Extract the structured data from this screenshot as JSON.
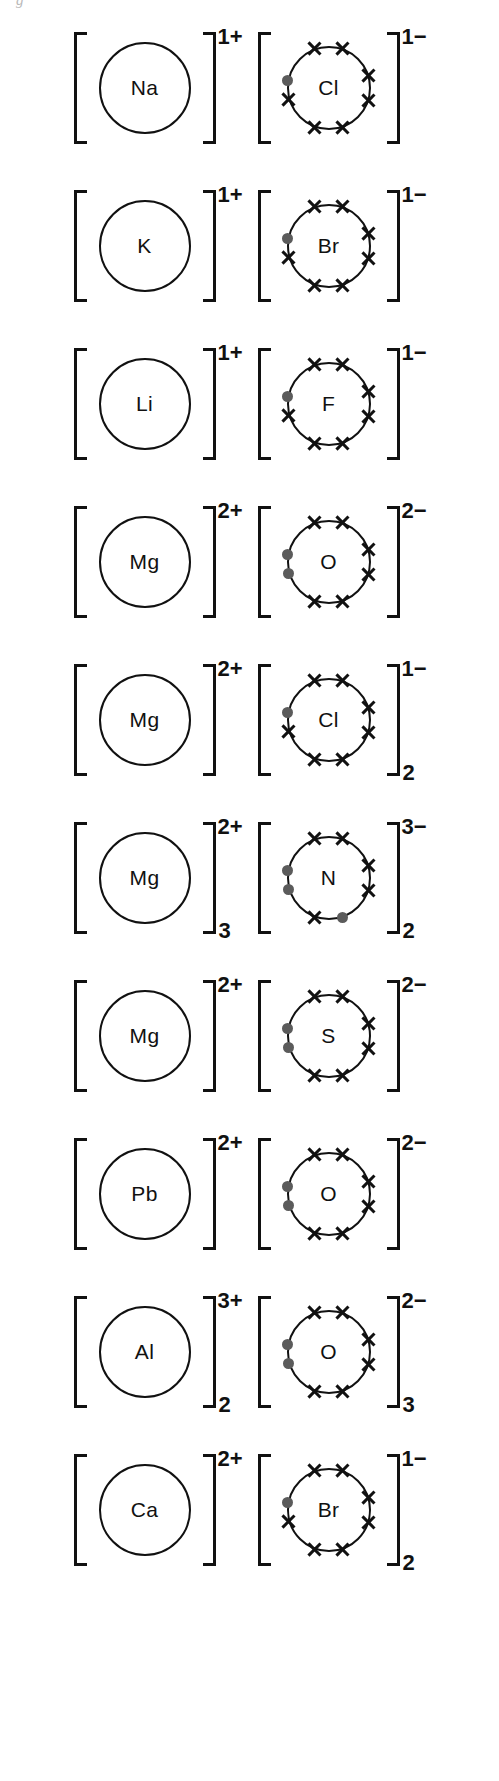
{
  "page": {
    "artifact_text": "g",
    "width": 499,
    "height": 1781,
    "ink_color": "#111111",
    "dot_color": "#5b5b5b"
  },
  "diagram": {
    "type": "dot-and-cross ionic bonding diagrams",
    "electron_legend": {
      "cross": "outer-shell electron belonging to the non-metal atom",
      "dot": "electron transferred from the metal atom"
    },
    "rows": [
      {
        "compound": "NaCl",
        "cation": {
          "symbol": "Na",
          "charge": "1+",
          "subscript": "",
          "crosses": 0,
          "dots": 0
        },
        "anion": {
          "symbol": "Cl",
          "charge": "1−",
          "subscript": "",
          "crosses": 7,
          "dots": 1
        }
      },
      {
        "compound": "KBr",
        "cation": {
          "symbol": "K",
          "charge": "1+",
          "subscript": "",
          "crosses": 0,
          "dots": 0
        },
        "anion": {
          "symbol": "Br",
          "charge": "1−",
          "subscript": "",
          "crosses": 7,
          "dots": 1
        }
      },
      {
        "compound": "LiF",
        "cation": {
          "symbol": "Li",
          "charge": "1+",
          "subscript": "",
          "crosses": 0,
          "dots": 0
        },
        "anion": {
          "symbol": "F",
          "charge": "1−",
          "subscript": "",
          "crosses": 7,
          "dots": 1
        }
      },
      {
        "compound": "MgO",
        "cation": {
          "symbol": "Mg",
          "charge": "2+",
          "subscript": "",
          "crosses": 0,
          "dots": 0
        },
        "anion": {
          "symbol": "O",
          "charge": "2−",
          "subscript": "",
          "crosses": 6,
          "dots": 2
        }
      },
      {
        "compound": "MgCl2",
        "cation": {
          "symbol": "Mg",
          "charge": "2+",
          "subscript": "",
          "crosses": 0,
          "dots": 0
        },
        "anion": {
          "symbol": "Cl",
          "charge": "1−",
          "subscript": "2",
          "crosses": 7,
          "dots": 1
        }
      },
      {
        "compound": "Mg3N2",
        "cation": {
          "symbol": "Mg",
          "charge": "2+",
          "subscript": "3",
          "crosses": 0,
          "dots": 0
        },
        "anion": {
          "symbol": "N",
          "charge": "3−",
          "subscript": "2",
          "crosses": 5,
          "dots": 3
        }
      },
      {
        "compound": "MgS",
        "cation": {
          "symbol": "Mg",
          "charge": "2+",
          "subscript": "",
          "crosses": 0,
          "dots": 0
        },
        "anion": {
          "symbol": "S",
          "charge": "2−",
          "subscript": "",
          "crosses": 6,
          "dots": 2
        }
      },
      {
        "compound": "PbO",
        "cation": {
          "symbol": "Pb",
          "charge": "2+",
          "subscript": "",
          "crosses": 0,
          "dots": 0
        },
        "anion": {
          "symbol": "O",
          "charge": "2−",
          "subscript": "",
          "crosses": 6,
          "dots": 2
        }
      },
      {
        "compound": "Al2O3",
        "cation": {
          "symbol": "Al",
          "charge": "3+",
          "subscript": "2",
          "crosses": 0,
          "dots": 0
        },
        "anion": {
          "symbol": "O",
          "charge": "2−",
          "subscript": "3",
          "crosses": 6,
          "dots": 2
        }
      },
      {
        "compound": "CaBr2",
        "cation": {
          "symbol": "Ca",
          "charge": "2+",
          "subscript": "",
          "crosses": 0,
          "dots": 0
        },
        "anion": {
          "symbol": "Br",
          "charge": "1−",
          "subscript": "2",
          "crosses": 7,
          "dots": 1
        }
      }
    ]
  }
}
